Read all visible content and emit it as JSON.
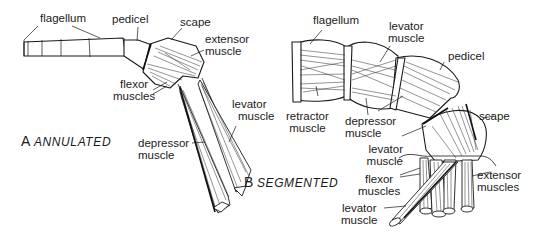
{
  "figure": {
    "panels": [
      {
        "letter": "A",
        "title": "ANNULATED",
        "labels": {
          "flagellum": "flagellum",
          "pedicel": "pedicel",
          "scape": "scape",
          "extensor": [
            "extensor",
            "muscle"
          ],
          "flexor": [
            "flexor",
            "muscles"
          ],
          "levator": [
            "levator",
            "muscle"
          ],
          "depressor": [
            "depressor",
            "muscle"
          ]
        }
      },
      {
        "letter": "B",
        "title": "SEGMENTED",
        "labels": {
          "flagellum": "flagellum",
          "levator_top": [
            "levator",
            "muscle"
          ],
          "pedicel": "pedicel",
          "retractor": [
            "retractor",
            "muscle"
          ],
          "depressor": [
            "depressor",
            "muscle"
          ],
          "scape": "scape",
          "levator_mid": [
            "levator",
            "muscle"
          ],
          "flexor": [
            "flexor",
            "muscles"
          ],
          "extensor": [
            "extensor",
            "muscles"
          ],
          "levator_bottom": [
            "levator",
            "muscle"
          ]
        }
      }
    ]
  }
}
